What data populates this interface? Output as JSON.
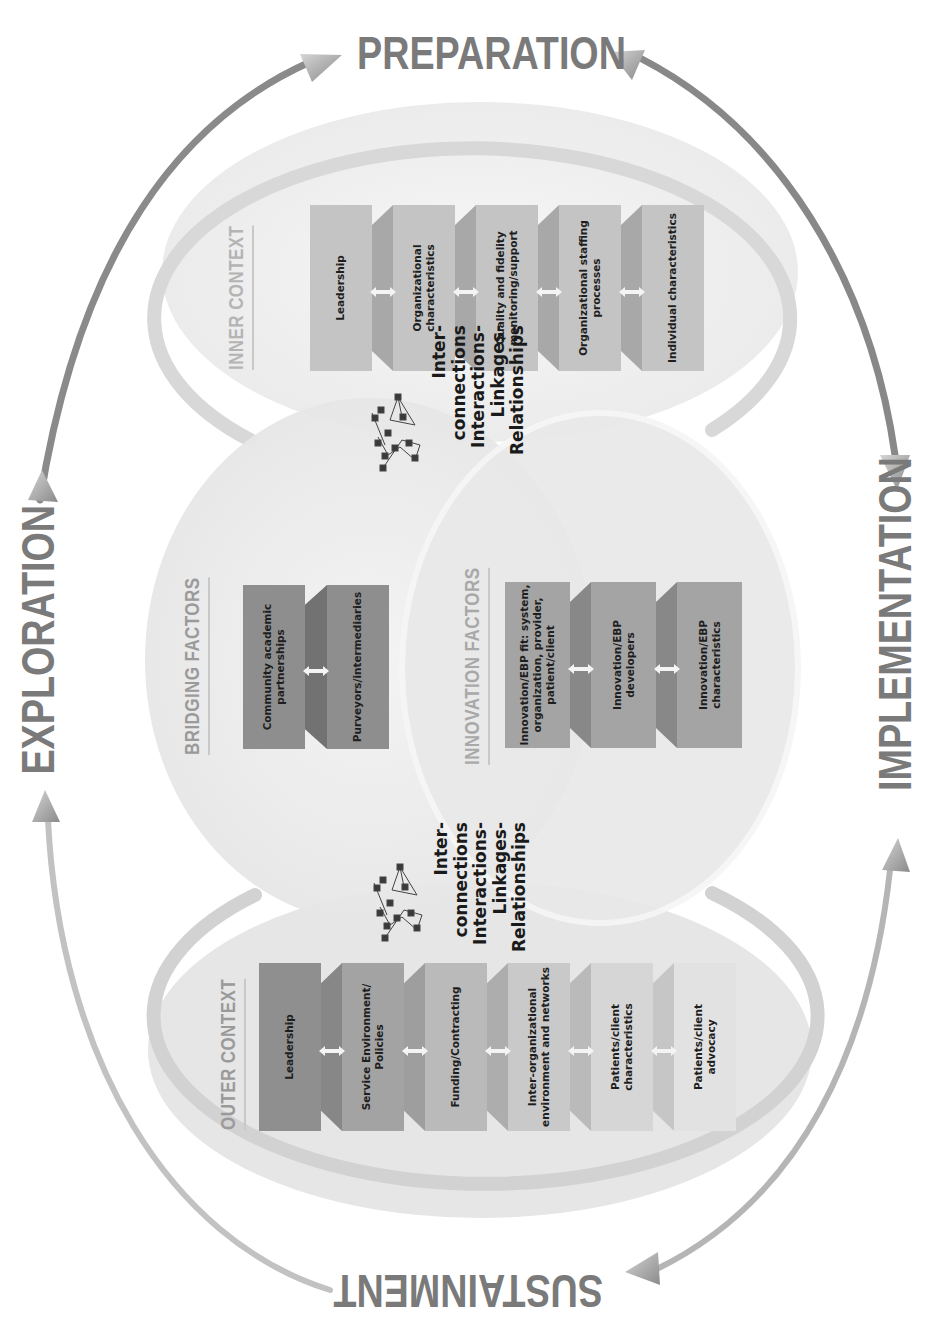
{
  "phases": {
    "top": "PREPARATION",
    "left": "EXPLORATION",
    "right": "IMPLEMENTATION",
    "bottom": "SUSTAINMENT"
  },
  "inner_context": {
    "label": "INNER CONTEXT",
    "items": [
      "Leadership",
      "Organizational characteristics",
      "Quality and fidelity monitoring/support",
      "Organizational staffing processes",
      "Individual characteristics"
    ],
    "lines": [
      [
        "Leadership"
      ],
      [
        "Organizational",
        "characteristics"
      ],
      [
        "Quality and fidelity",
        "monitoring/support"
      ],
      [
        "Organizational staffing",
        "processes"
      ],
      [
        "Individual characteristics"
      ]
    ]
  },
  "bridging_factors": {
    "label": "BRIDGING FACTORS",
    "lines": [
      [
        "Community academic",
        "partnerships"
      ],
      [
        "Purveyors/intermediaries"
      ]
    ]
  },
  "innovation_factors": {
    "label": "INNOVATION FACTORS",
    "lines": [
      [
        "Innovation/EBP fit: system,",
        "organization, provider,",
        "patient/client"
      ],
      [
        "Innovation/EBP",
        "developers"
      ],
      [
        "Innovation/EBP",
        "characteristics"
      ]
    ]
  },
  "outer_context": {
    "label": "OUTER CONTEXT",
    "lines": [
      [
        "Leadership"
      ],
      [
        "Service Environment/",
        "Policies"
      ],
      [
        "Funding/Contracting"
      ],
      [
        "Inter-organizational",
        "environment and networks"
      ],
      [
        "Patients/client",
        "characteristics"
      ],
      [
        "Patients/client",
        "advocacy"
      ]
    ]
  },
  "interconnections": {
    "upper": [
      "Inter-",
      "connections",
      "Interactions-",
      "Linkages-",
      "Relationships"
    ],
    "lower": [
      "Inter-",
      "connections",
      "Interactions-",
      "Linkages-",
      "Relationships"
    ],
    "icon": "network-graph-icon"
  },
  "colors": {
    "phase_text": "#7a7a7a",
    "cycle_arrow": "#8c8c8c",
    "ellipse_fill": "#ececec",
    "ellipse_ring": "#d6d6d6",
    "inner_box": "#c4c4c4",
    "bridging_box": "#8e8e8e",
    "innovation_box": "#a4a4a4",
    "outer_boxes": [
      "#8f8f8f",
      "#a3a3a3",
      "#bababa",
      "#c9c9c9",
      "#d6d6d6",
      "#e2e2e2"
    ]
  }
}
